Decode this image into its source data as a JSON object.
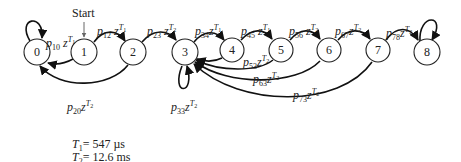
{
  "diagram": {
    "start_label": "Start",
    "nodes": [
      "0",
      "1",
      "2",
      "3",
      "4",
      "5",
      "6",
      "7",
      "8"
    ],
    "edges": [
      {
        "from": "0",
        "to": "0",
        "prob": "10",
        "time": "1",
        "kind": "self-loop"
      },
      {
        "from": "1",
        "to": "0",
        "prob": "10",
        "time": "1"
      },
      {
        "from": "1",
        "to": "2",
        "prob": "12",
        "time": "1"
      },
      {
        "from": "2",
        "to": "0",
        "prob": "20",
        "time": "2"
      },
      {
        "from": "2",
        "to": "3",
        "prob": "23",
        "time": "2"
      },
      {
        "from": "3",
        "to": "3",
        "prob": "33",
        "time": "2",
        "kind": "self-loop"
      },
      {
        "from": "3",
        "to": "4",
        "prob": "34",
        "time": "1"
      },
      {
        "from": "4",
        "to": "3",
        "prob": "",
        "time": ""
      },
      {
        "from": "4",
        "to": "5",
        "prob": "45",
        "time": "1"
      },
      {
        "from": "5",
        "to": "3",
        "prob": "53",
        "time": "2"
      },
      {
        "from": "5",
        "to": "6",
        "prob": "56",
        "time": "2"
      },
      {
        "from": "6",
        "to": "3",
        "prob": "63",
        "time": "2"
      },
      {
        "from": "6",
        "to": "7",
        "prob": "67",
        "time": "2"
      },
      {
        "from": "7",
        "to": "3",
        "prob": "73",
        "time": "2"
      },
      {
        "from": "7",
        "to": "8",
        "prob": "78",
        "time": "2"
      },
      {
        "from": "8",
        "to": "8",
        "prob": "",
        "time": "",
        "kind": "self-loop"
      }
    ],
    "labels": {
      "p10": {
        "sub": "10",
        "tsub": "1"
      },
      "p12": {
        "sub": "12",
        "tsub": "1"
      },
      "p23": {
        "sub": "23",
        "tsub": "2"
      },
      "p34": {
        "sub": "34",
        "tsub": "1"
      },
      "p45": {
        "sub": "45",
        "tsub": "1"
      },
      "p56": {
        "sub": "56",
        "tsub": "2"
      },
      "p67": {
        "sub": "67",
        "tsub": "2"
      },
      "p78": {
        "sub": "78",
        "tsub": "2"
      },
      "p53": {
        "sub": "53",
        "tsub": "2"
      },
      "p63": {
        "sub": "63",
        "tsub": "2"
      },
      "p73": {
        "sub": "73",
        "tsub": "2"
      },
      "p20": {
        "sub": "20",
        "tsub": "2"
      },
      "p33": {
        "sub": "33",
        "tsub": "2"
      }
    },
    "symbols": {
      "p": "p",
      "z": "z",
      "T": "T"
    }
  },
  "timing": {
    "t1": {
      "sub": "1",
      "value": "= 547 µs"
    },
    "t2": {
      "sub": "2",
      "value": "= 12.6 ms"
    }
  }
}
